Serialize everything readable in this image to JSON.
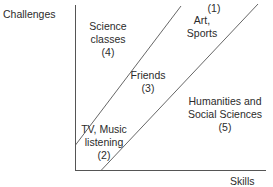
{
  "axes": {
    "y_label": "Challenges",
    "x_label": "Skills"
  },
  "regions": [
    {
      "id": "4",
      "line1": "Science",
      "line2": "classes",
      "number": "(4)"
    },
    {
      "id": "3",
      "line1": "Friends",
      "number": "(3)"
    },
    {
      "id": "1",
      "line1": "Art,",
      "line2": "Sports",
      "number": "(1)"
    },
    {
      "id": "2",
      "line1": "TV, Music",
      "line2": "listening",
      "number": "(2)"
    },
    {
      "id": "5",
      "line1": "Humanities and",
      "line2": "Social Sciences",
      "number": "(5)"
    }
  ],
  "colors": {
    "axis": "#555555",
    "line": "#555555",
    "text": "#2b2b2b"
  }
}
